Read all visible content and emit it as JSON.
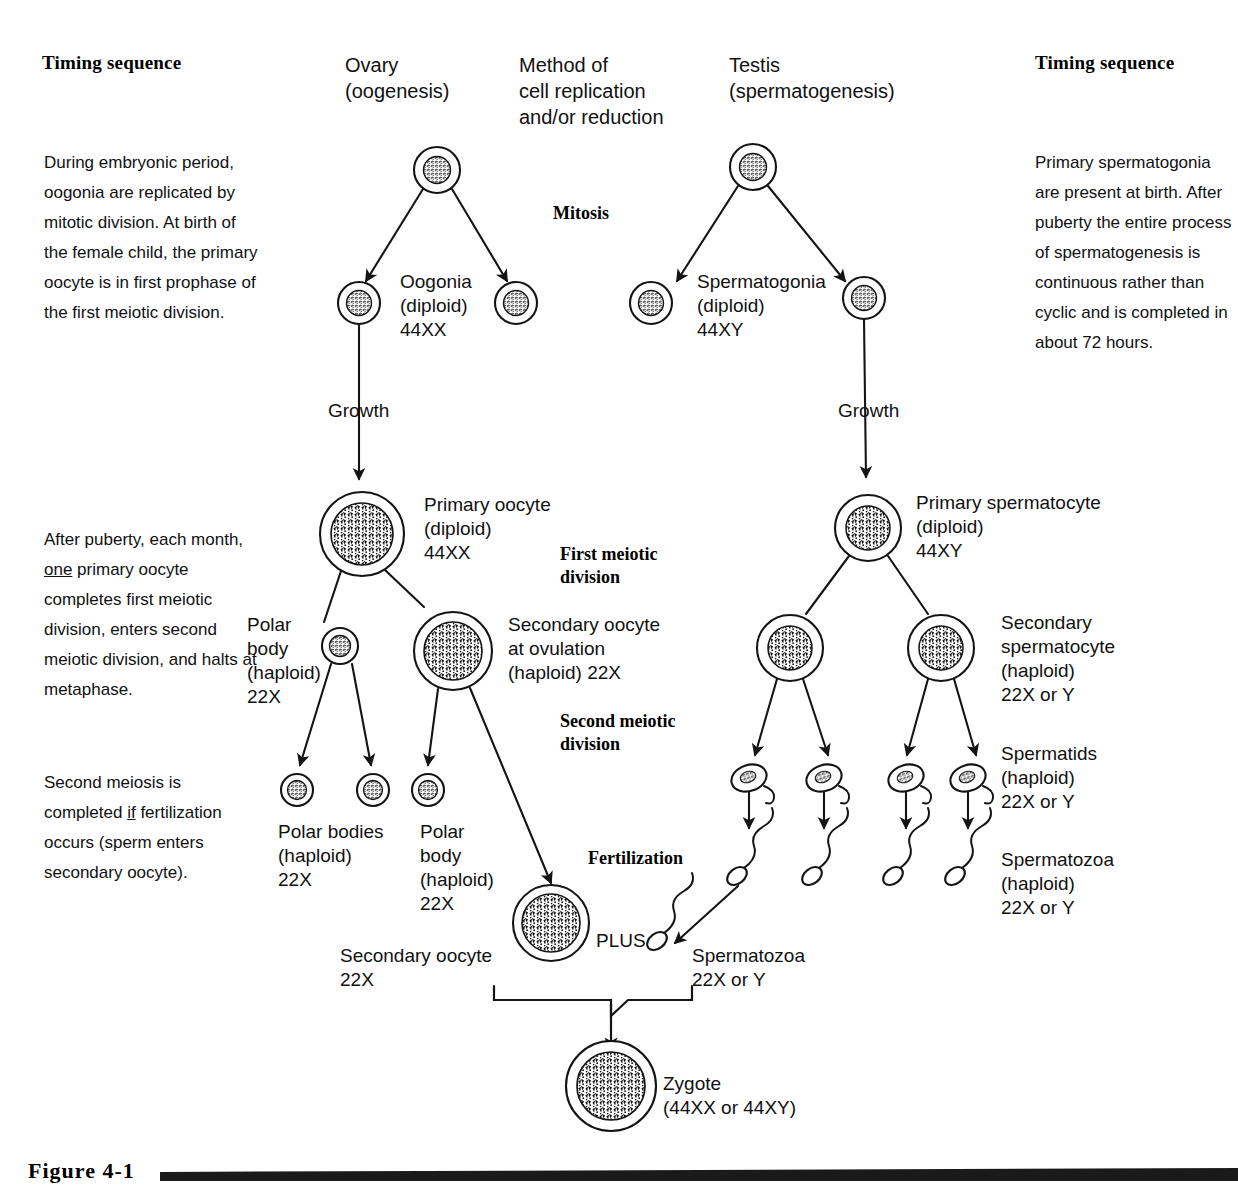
{
  "headers": {
    "timing_left": "Timing sequence",
    "timing_right": "Timing sequence",
    "ovary": "Ovary\n(oogenesis)",
    "method": "Method of\ncell replication\nand/or reduction",
    "testis": "Testis\n(spermatogenesis)"
  },
  "left_column": {
    "paragraph1_part1": "During embryonic period, oogonia are replicated by mitotic division. At birth of the female child, the primary oocyte is in first prophase of the first meiotic division.",
    "paragraph2_a": "After puberty, each month, ",
    "paragraph2_underline": "one",
    "paragraph2_b": " primary oocyte completes first meiotic division, enters second meiotic division, and halts at metaphase.",
    "paragraph3_a": "Second meiosis is completed ",
    "paragraph3_underline": "if",
    "paragraph3_b": " fertilization occurs (sperm enters secondary oocyte)."
  },
  "right_column": {
    "paragraph1": "Primary spermatogonia are present at birth. After puberty the entire process of spermatogenesis is continuous rather than cyclic and is completed in about 72 hours."
  },
  "process_labels": {
    "mitosis": "Mitosis",
    "first_meiotic": "First meiotic\ndivision",
    "second_meiotic": "Second meiotic\ndivision",
    "fertilization": "Fertilization",
    "growth_left": "Growth",
    "growth_right": "Growth",
    "plus": "PLUS"
  },
  "oogenesis_labels": {
    "oogonia": "Oogonia\n(diploid)\n44XX",
    "primary_oocyte": "Primary oocyte\n(diploid)\n44XX",
    "polar_body": "Polar\nbody\n(haploid)\n22X",
    "secondary_oocyte_ovulation": "Secondary oocyte\nat ovulation\n(haploid) 22X",
    "polar_bodies": "Polar bodies\n(haploid)\n22X",
    "polar_body2": "Polar\nbody\n(haploid)\n22X",
    "secondary_oocyte": "Secondary oocyte\n22X"
  },
  "spermatogenesis_labels": {
    "spermatogonia": "Spermatogonia\n(diploid)\n44XY",
    "primary_spermatocyte": "Primary spermatocyte\n(diploid)\n44XY",
    "secondary_spermatocyte": "Secondary\nspermatocyte\n(haploid)\n22X or Y",
    "spermatids": "Spermatids\n(haploid)\n22X or Y",
    "spermatozoa": "Spermatozoa\n(haploid)\n22X or Y",
    "spermatozoa_fert": "Spermatozoa\n22X or Y"
  },
  "zygote_label": "Zygote\n(44XX or 44XY)",
  "figure": {
    "caption": "Figure 4-1"
  },
  "colors": {
    "ink": "#111111",
    "line": "#1a1a1a",
    "background": "#ffffff"
  }
}
